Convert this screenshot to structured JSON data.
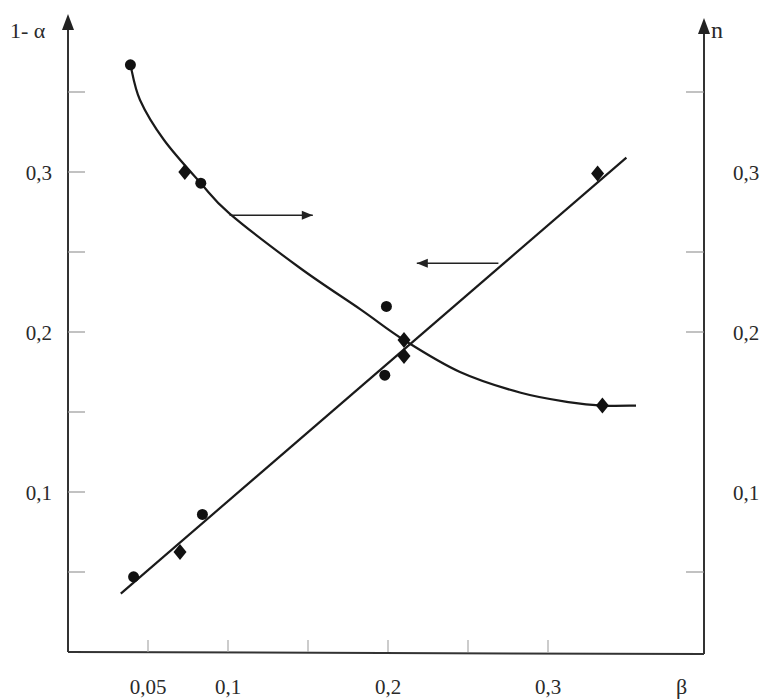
{
  "chart_data": {
    "type": "scatter",
    "title": "",
    "xlabel": "β",
    "ylabel_left": "1- α",
    "ylabel_right": "n",
    "xlim": [
      0,
      0.395
    ],
    "ylim_left": [
      0,
      0.395
    ],
    "ylim_right": [
      0,
      0.395
    ],
    "grid": false,
    "x_ticks": [
      0.05,
      0.1,
      0.15,
      0.2,
      0.25,
      0.3
    ],
    "x_tick_labels": [
      {
        "value": 0.05,
        "label": "0,05"
      },
      {
        "value": 0.1,
        "label": "0,1"
      },
      {
        "value": 0.2,
        "label": "0,2"
      },
      {
        "value": 0.3,
        "label": "0,3"
      }
    ],
    "left_ticks": [
      0.05,
      0.1,
      0.15,
      0.2,
      0.25,
      0.3,
      0.35
    ],
    "left_tick_labels": [
      {
        "value": 0.1,
        "label": "0,1"
      },
      {
        "value": 0.2,
        "label": "0,2"
      },
      {
        "value": 0.3,
        "label": "0,3"
      }
    ],
    "right_ticks": [
      0.05,
      0.2,
      0.25,
      0.35
    ],
    "right_tick_labels": [
      {
        "value": 0.1,
        "label": "0,1"
      },
      {
        "value": 0.2,
        "label": "0,2"
      },
      {
        "value": 0.3,
        "label": "0,3"
      }
    ],
    "series": [
      {
        "name": "1-α (circles)",
        "axis": "left",
        "marker": "circle",
        "points": [
          [
            0.039,
            0.367
          ],
          [
            0.083,
            0.293
          ],
          [
            0.199,
            0.216
          ]
        ]
      },
      {
        "name": "1-α (diamonds)",
        "axis": "left",
        "marker": "diamond",
        "points": [
          [
            0.073,
            0.3
          ],
          [
            0.21,
            0.195
          ],
          [
            0.334,
            0.154
          ]
        ]
      },
      {
        "name": "n (circles)",
        "axis": "right",
        "marker": "circle",
        "points": [
          [
            0.041,
            0.047
          ],
          [
            0.084,
            0.086
          ],
          [
            0.198,
            0.173
          ]
        ]
      },
      {
        "name": "n (diamonds)",
        "axis": "right",
        "marker": "diamond",
        "points": [
          [
            0.07,
            0.0625
          ],
          [
            0.21,
            0.185
          ],
          [
            0.331,
            0.299
          ]
        ]
      }
    ],
    "fits": [
      {
        "name": "1-α curve",
        "axis": "left",
        "kind": "decreasing curve",
        "points": [
          [
            0.039,
            0.367
          ],
          [
            0.045,
            0.345
          ],
          [
            0.06,
            0.32
          ],
          [
            0.083,
            0.293
          ],
          [
            0.101,
            0.274
          ],
          [
            0.145,
            0.24
          ],
          [
            0.183,
            0.214
          ],
          [
            0.21,
            0.195
          ],
          [
            0.245,
            0.175
          ],
          [
            0.283,
            0.162
          ],
          [
            0.314,
            0.156
          ],
          [
            0.334,
            0.154
          ],
          [
            0.355,
            0.154
          ]
        ]
      },
      {
        "name": "n line",
        "axis": "right",
        "kind": "linear",
        "points": [
          [
            0.033,
            0.0365
          ],
          [
            0.349,
            0.309
          ]
        ]
      }
    ],
    "annotations": [
      {
        "type": "arrow",
        "direction": "right",
        "from_curve": "1-α curve",
        "meaning": "refers to right axis n? (as drawn: points right)",
        "x_from": 0.101,
        "x_to": 0.153,
        "y": 0.273
      },
      {
        "type": "arrow",
        "direction": "left",
        "from_curve": "n line",
        "meaning": "points to left",
        "x_from": 0.269,
        "x_to": 0.218,
        "y": 0.243
      }
    ]
  }
}
